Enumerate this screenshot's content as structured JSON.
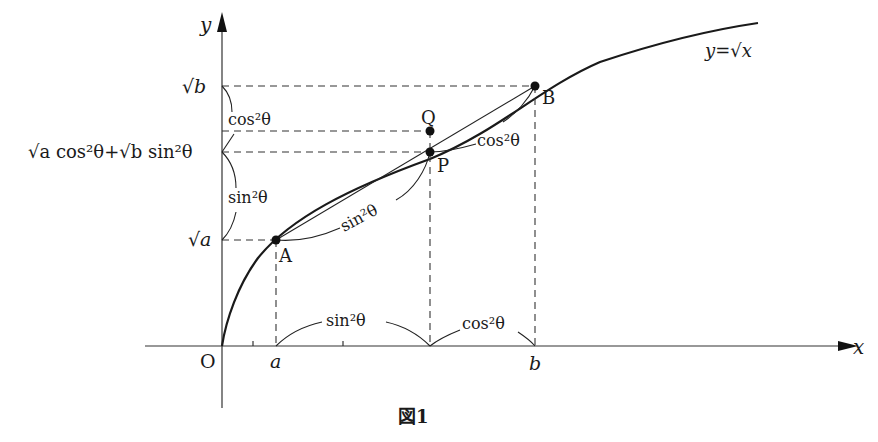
{
  "figure": {
    "caption": "図1",
    "curve_label": "y=√x",
    "axes": {
      "x_label": "x",
      "y_label": "y",
      "origin_label": "O"
    },
    "x_ticks": {
      "a": "a",
      "b": "b"
    },
    "y_ticks": {
      "sqrt_a": "√a",
      "sqrt_b": "√b",
      "mid": "√a cos²θ+√b sin²θ"
    },
    "points": [
      {
        "name": "A",
        "label": "A"
      },
      {
        "name": "P",
        "label": "P"
      },
      {
        "name": "Q",
        "label": "Q"
      },
      {
        "name": "B",
        "label": "B"
      }
    ],
    "braces": {
      "y_upper": "cos²θ",
      "y_lower": "sin²θ",
      "x_left": "sin²θ",
      "x_right": "cos²θ",
      "seg_AP": "sin²θ",
      "seg_PB": "cos²θ"
    }
  },
  "colors": {
    "ink": "#1a1a1a",
    "background": "#ffffff"
  }
}
